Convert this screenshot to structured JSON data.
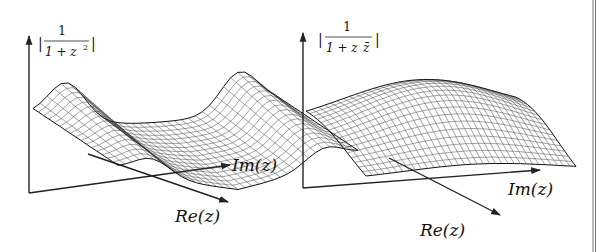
{
  "panels": [
    {
      "id": "left",
      "function_label": {
        "bar": "|",
        "numerator": "1",
        "denominator_base": "1 + z",
        "denominator_exp": "2",
        "bar_right": "|"
      },
      "axes": {
        "x_label": "Im(z)",
        "y_label": "Re(z)"
      },
      "surface": "saddle",
      "description": "Wireframe surface of |1/(1+z^2)| showing two peaks with a saddle between"
    },
    {
      "id": "right",
      "function_label": {
        "bar": "|",
        "numerator": "1",
        "denominator": "1 + z",
        "denominator_conj": "z̄",
        "bar_right": "|"
      },
      "axes": {
        "x_label": "Im(z)",
        "y_label": "Re(z)"
      },
      "surface": "dome",
      "description": "Wireframe surface of |1/(1+z z̄)| showing a single smooth dome"
    }
  ],
  "colors": {
    "ink": "#222222",
    "mesh": "#333333",
    "background": "#ffffff"
  }
}
